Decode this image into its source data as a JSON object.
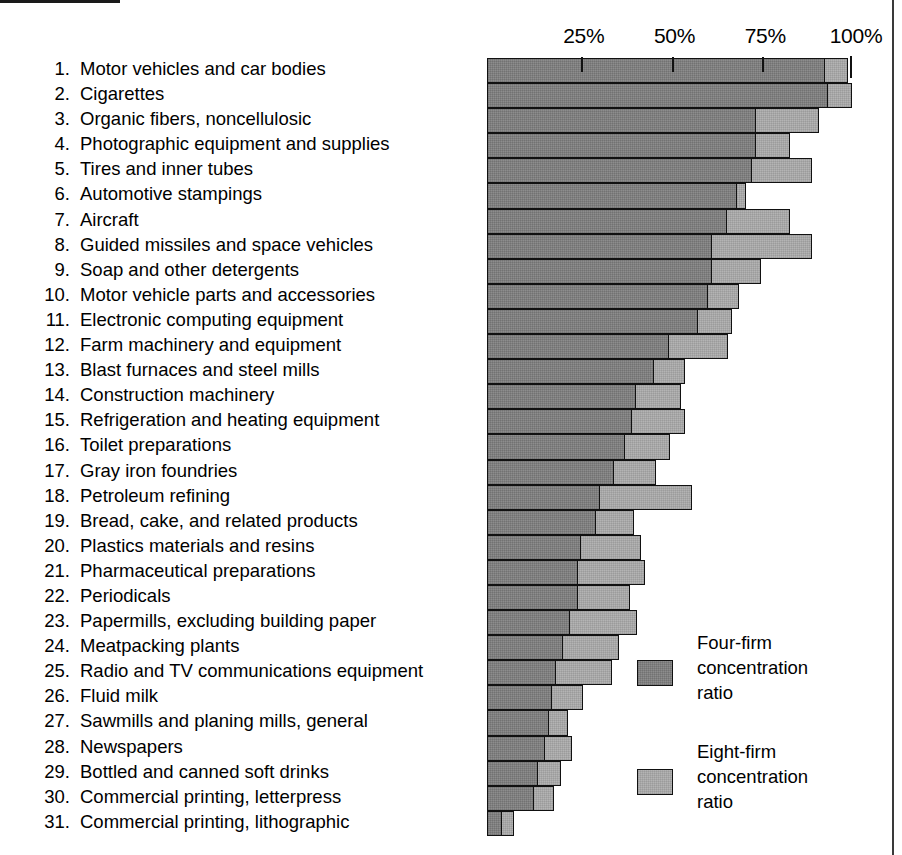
{
  "axis": {
    "ticks": [
      {
        "label": "25%",
        "value": 25
      },
      {
        "label": "50%",
        "value": 50
      },
      {
        "label": "75%",
        "value": 75
      },
      {
        "label": "100%",
        "value": 100
      }
    ],
    "min": 0,
    "max": 100
  },
  "legend": {
    "entries": [
      {
        "key": "four",
        "line1": "Four-firm",
        "line2": "concentration",
        "line3": "ratio",
        "color": "#8d8d8d"
      },
      {
        "key": "eight",
        "line1": "Eight-firm",
        "line2": "concentration",
        "line3": "ratio",
        "color": "#b4b4b4"
      }
    ]
  },
  "chart_data": {
    "type": "bar",
    "orientation": "horizontal",
    "stacked_overlay": true,
    "title": "",
    "xlabel": "",
    "ylabel": "",
    "xlim": [
      0,
      100
    ],
    "grid": false,
    "legend_position": "inside-bottom-right",
    "tick_labels": [
      "25%",
      "50%",
      "75%",
      "100%"
    ],
    "series": [
      {
        "name": "Four-firm concentration ratio",
        "key": "four",
        "color": "#8d8d8d"
      },
      {
        "name": "Eight-firm concentration ratio",
        "key": "eight",
        "color": "#b4b4b4"
      }
    ],
    "rows": [
      {
        "rank": "1.",
        "label": "Motor vehicles and car bodies",
        "four": 93,
        "eight": 99
      },
      {
        "rank": "2.",
        "label": "Cigarettes",
        "four": 94,
        "eight": 100
      },
      {
        "rank": "3.",
        "label": "Organic fibers, noncellulosic",
        "four": 74,
        "eight": 91
      },
      {
        "rank": "4.",
        "label": "Photographic equipment and supplies",
        "four": 74,
        "eight": 83
      },
      {
        "rank": "5.",
        "label": "Tires and inner tubes",
        "four": 73,
        "eight": 89
      },
      {
        "rank": "6.",
        "label": "Automotive stampings",
        "four": 69,
        "eight": 71
      },
      {
        "rank": "7.",
        "label": "Aircraft",
        "four": 66,
        "eight": 83
      },
      {
        "rank": "8.",
        "label": "Guided missiles and space vehicles",
        "four": 62,
        "eight": 89
      },
      {
        "rank": "9.",
        "label": "Soap and other detergents",
        "four": 62,
        "eight": 75
      },
      {
        "rank": "10.",
        "label": "Motor vehicle parts and accessories",
        "four": 61,
        "eight": 69
      },
      {
        "rank": "11.",
        "label": "Electronic computing equipment",
        "four": 58,
        "eight": 67
      },
      {
        "rank": "12.",
        "label": "Farm machinery and equipment",
        "four": 50,
        "eight": 66
      },
      {
        "rank": "13.",
        "label": "Blast furnaces and steel mills",
        "four": 46,
        "eight": 54
      },
      {
        "rank": "14.",
        "label": "Construction machinery",
        "four": 41,
        "eight": 53
      },
      {
        "rank": "15.",
        "label": "Refrigeration and heating equipment",
        "four": 40,
        "eight": 54
      },
      {
        "rank": "16.",
        "label": "Toilet preparations",
        "four": 38,
        "eight": 50
      },
      {
        "rank": "17.",
        "label": "Gray iron foundries",
        "four": 35,
        "eight": 46
      },
      {
        "rank": "18.",
        "label": "Petroleum refining",
        "four": 31,
        "eight": 56
      },
      {
        "rank": "19.",
        "label": "Bread, cake, and related products",
        "four": 30,
        "eight": 40
      },
      {
        "rank": "20.",
        "label": "Plastics materials and resins",
        "four": 26,
        "eight": 42
      },
      {
        "rank": "21.",
        "label": "Pharmaceutical preparations",
        "four": 25,
        "eight": 43
      },
      {
        "rank": "22.",
        "label": "Periodicals",
        "four": 25,
        "eight": 39
      },
      {
        "rank": "23.",
        "label": "Papermills, excluding building paper",
        "four": 23,
        "eight": 41
      },
      {
        "rank": "24.",
        "label": "Meatpacking plants",
        "four": 21,
        "eight": 36
      },
      {
        "rank": "25.",
        "label": "Radio and TV communications equipment",
        "four": 19,
        "eight": 34
      },
      {
        "rank": "26.",
        "label": "Fluid milk",
        "four": 18,
        "eight": 26
      },
      {
        "rank": "27.",
        "label": "Sawmills and planing mills, general",
        "four": 17,
        "eight": 22
      },
      {
        "rank": "28.",
        "label": "Newspapers",
        "four": 16,
        "eight": 23
      },
      {
        "rank": "29.",
        "label": "Bottled and canned soft drinks",
        "four": 14,
        "eight": 20
      },
      {
        "rank": "30.",
        "label": "Commercial printing, letterpress",
        "four": 13,
        "eight": 18
      },
      {
        "rank": "31.",
        "label": "Commercial printing, lithographic",
        "four": 4,
        "eight": 7
      }
    ]
  }
}
